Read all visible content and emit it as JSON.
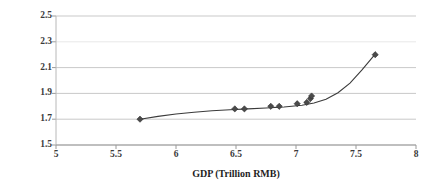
{
  "chart_data": {
    "type": "scatter",
    "title": "",
    "xlabel": "GDP (Trillion RMB)",
    "ylabel": "carbon emission (billion tons)",
    "xlim": [
      5,
      8
    ],
    "ylim": [
      1.5,
      2.5
    ],
    "xticks": [
      "5",
      "5.5",
      "6",
      "6.5",
      "7",
      "7.5",
      "8"
    ],
    "xtick_values": [
      5,
      5.5,
      6,
      6.5,
      7,
      7.5,
      8
    ],
    "yticks": [
      "1.5",
      "1.7",
      "1.9",
      "2.1",
      "2.3",
      "2.5"
    ],
    "ytick_values": [
      1.5,
      1.7,
      1.9,
      2.1,
      2.3,
      2.5
    ],
    "grid": "horizontal",
    "legend": "none",
    "marker": "diamond",
    "marker_color": "#4a4a4a",
    "line_color": "#3b3b3b",
    "grid_color": "#c9c9c9",
    "series": [
      {
        "name": "GDP vs carbon emission",
        "points": [
          {
            "x": 5.7,
            "y": 1.7
          },
          {
            "x": 6.49,
            "y": 1.78
          },
          {
            "x": 6.57,
            "y": 1.78
          },
          {
            "x": 6.79,
            "y": 1.8
          },
          {
            "x": 6.86,
            "y": 1.8
          },
          {
            "x": 7.01,
            "y": 1.82
          },
          {
            "x": 7.09,
            "y": 1.83
          },
          {
            "x": 7.12,
            "y": 1.86
          },
          {
            "x": 7.13,
            "y": 1.88
          },
          {
            "x": 7.66,
            "y": 2.2
          }
        ]
      }
    ],
    "fit_curve": {
      "name": "fitted trend",
      "points": [
        {
          "x": 5.7,
          "y": 1.7
        },
        {
          "x": 5.85,
          "y": 1.722
        },
        {
          "x": 6.0,
          "y": 1.74
        },
        {
          "x": 6.15,
          "y": 1.754
        },
        {
          "x": 6.3,
          "y": 1.765
        },
        {
          "x": 6.45,
          "y": 1.773
        },
        {
          "x": 6.6,
          "y": 1.78
        },
        {
          "x": 6.75,
          "y": 1.787
        },
        {
          "x": 6.9,
          "y": 1.795
        },
        {
          "x": 7.05,
          "y": 1.808
        },
        {
          "x": 7.15,
          "y": 1.825
        },
        {
          "x": 7.25,
          "y": 1.855
        },
        {
          "x": 7.35,
          "y": 1.905
        },
        {
          "x": 7.45,
          "y": 1.98
        },
        {
          "x": 7.55,
          "y": 2.082
        },
        {
          "x": 7.66,
          "y": 2.205
        }
      ]
    }
  },
  "axes": {
    "x_axis_name": "GDP (Trillion RMB)",
    "y_axis_name": "carbon emission (billion tons)"
  }
}
